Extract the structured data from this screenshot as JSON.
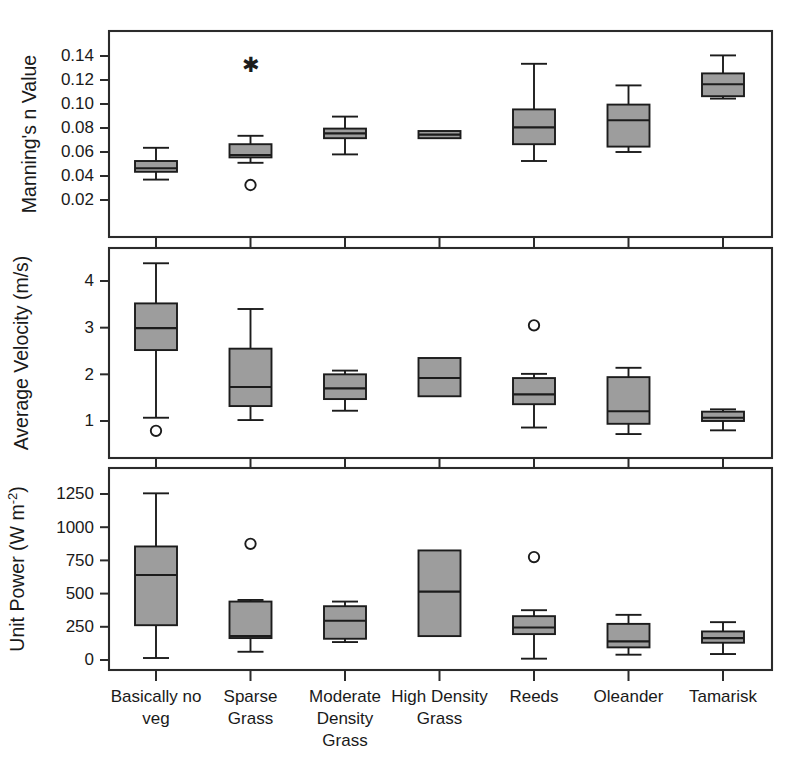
{
  "figure": {
    "background_color": "#ffffff",
    "box_fill_color": "#9d9d9d",
    "line_color": "#1c1c1c"
  },
  "chart_data": [
    {
      "type": "box",
      "panel": 1,
      "title": "",
      "ylabel": "Manning's n Value",
      "xlabel": "",
      "ylim": [
        0.0125,
        0.156
      ],
      "yticks": [
        0.02,
        0.04,
        0.06,
        0.08,
        0.1,
        0.12,
        0.14
      ],
      "ytick_labels": [
        "0.02",
        "0.04",
        "0.06",
        "0.08",
        "0.10",
        "0.12",
        "0.14"
      ],
      "grid": false,
      "legend": "none",
      "categories": [
        "Basically no veg",
        "Sparse Grass",
        "Moderate Density Grass",
        "High Density Grass",
        "Reeds",
        "Oleander",
        "Tamarisk"
      ],
      "boxes": [
        {
          "category": "Basically no veg",
          "whisker_low": 0.037,
          "q1": 0.0435,
          "median": 0.0465,
          "q3": 0.0525,
          "whisker_high": 0.0635,
          "outliers": [],
          "stars": []
        },
        {
          "category": "Sparse Grass",
          "whisker_low": 0.051,
          "q1": 0.0555,
          "median": 0.0575,
          "q3": 0.0665,
          "whisker_high": 0.0735,
          "outliers": [
            0.0325
          ],
          "stars": [
            0.1325
          ]
        },
        {
          "category": "Moderate Density Grass",
          "whisker_low": 0.058,
          "q1": 0.0715,
          "median": 0.0755,
          "q3": 0.0795,
          "whisker_high": 0.0895,
          "outliers": [],
          "stars": []
        },
        {
          "category": "High Density Grass",
          "whisker_low": 0.0715,
          "q1": 0.0715,
          "median": 0.0745,
          "q3": 0.0775,
          "whisker_high": 0.0775,
          "outliers": [],
          "stars": []
        },
        {
          "category": "Reeds",
          "whisker_low": 0.0525,
          "q1": 0.0665,
          "median": 0.0805,
          "q3": 0.0955,
          "whisker_high": 0.1335,
          "outliers": [],
          "stars": []
        },
        {
          "category": "Oleander",
          "whisker_low": 0.06,
          "q1": 0.0645,
          "median": 0.0865,
          "q3": 0.0995,
          "whisker_high": 0.1155,
          "outliers": [],
          "stars": []
        },
        {
          "category": "Tamarisk",
          "whisker_low": 0.1045,
          "q1": 0.1065,
          "median": 0.1165,
          "q3": 0.1255,
          "whisker_high": 0.1405,
          "outliers": [],
          "stars": []
        }
      ]
    },
    {
      "type": "box",
      "panel": 2,
      "title": "",
      "ylabel": "Average Velocity (m/s)",
      "xlabel": "",
      "ylim": [
        0.45,
        4.75
      ],
      "yticks": [
        1,
        2,
        3,
        4
      ],
      "ytick_labels": [
        "1",
        "2",
        "3",
        "4"
      ],
      "grid": false,
      "legend": "none",
      "categories": [
        "Basically no veg",
        "Sparse Grass",
        "Moderate Density Grass",
        "High Density Grass",
        "Reeds",
        "Oleander",
        "Tamarisk"
      ],
      "boxes": [
        {
          "category": "Basically no veg",
          "whisker_low": 1.07,
          "q1": 2.52,
          "median": 2.99,
          "q3": 3.52,
          "whisker_high": 4.38,
          "outliers": [
            0.79
          ],
          "stars": []
        },
        {
          "category": "Sparse Grass",
          "whisker_low": 1.02,
          "q1": 1.32,
          "median": 1.73,
          "q3": 2.55,
          "whisker_high": 3.4,
          "outliers": [],
          "stars": []
        },
        {
          "category": "Moderate Density Grass",
          "whisker_low": 1.22,
          "q1": 1.47,
          "median": 1.7,
          "q3": 2.0,
          "whisker_high": 2.08,
          "outliers": [],
          "stars": []
        },
        {
          "category": "High Density Grass",
          "whisker_low": 1.53,
          "q1": 1.53,
          "median": 1.92,
          "q3": 2.35,
          "whisker_high": 2.35,
          "outliers": [],
          "stars": []
        },
        {
          "category": "Reeds",
          "whisker_low": 0.86,
          "q1": 1.36,
          "median": 1.57,
          "q3": 1.92,
          "whisker_high": 2.01,
          "outliers": [
            3.05
          ],
          "stars": []
        },
        {
          "category": "Oleander",
          "whisker_low": 0.72,
          "q1": 0.94,
          "median": 1.21,
          "q3": 1.94,
          "whisker_high": 2.14,
          "outliers": [],
          "stars": []
        },
        {
          "category": "Tamarisk",
          "whisker_low": 0.8,
          "q1": 1.0,
          "median": 1.07,
          "q3": 1.2,
          "whisker_high": 1.25,
          "outliers": [],
          "stars": []
        }
      ]
    },
    {
      "type": "box",
      "panel": 3,
      "title": "",
      "ylabel": "Unit Power (W m-2)",
      "ylabel_base": "Unit Power (W m",
      "ylabel_exponent": "-2",
      "ylabel_close": ")",
      "xlabel": "",
      "ylim": [
        -90,
        1450
      ],
      "yticks": [
        0,
        250,
        500,
        750,
        1000,
        1250
      ],
      "ytick_labels": [
        "0",
        "250",
        "500",
        "750",
        "1000",
        "1250"
      ],
      "grid": false,
      "legend": "none",
      "categories": [
        "Basically no veg",
        "Sparse Grass",
        "Moderate Density Grass",
        "High Density Grass",
        "Reeds",
        "Oleander",
        "Tamarisk"
      ],
      "boxes": [
        {
          "category": "Basically no veg",
          "whisker_low": 15,
          "q1": 262,
          "median": 640,
          "q3": 855,
          "whisker_high": 1255,
          "outliers": [],
          "stars": []
        },
        {
          "category": "Sparse Grass",
          "whisker_low": 62,
          "q1": 165,
          "median": 180,
          "q3": 440,
          "whisker_high": 452,
          "outliers": [
            875
          ],
          "stars": []
        },
        {
          "category": "Moderate Density Grass",
          "whisker_low": 135,
          "q1": 160,
          "median": 295,
          "q3": 405,
          "whisker_high": 440,
          "outliers": [],
          "stars": []
        },
        {
          "category": "High Density Grass",
          "whisker_low": 180,
          "q1": 180,
          "median": 515,
          "q3": 825,
          "whisker_high": 825,
          "outliers": [],
          "stars": []
        },
        {
          "category": "Reeds",
          "whisker_low": 10,
          "q1": 195,
          "median": 245,
          "q3": 330,
          "whisker_high": 375,
          "outliers": [
            775
          ],
          "stars": []
        },
        {
          "category": "Oleander",
          "whisker_low": 40,
          "q1": 95,
          "median": 140,
          "q3": 272,
          "whisker_high": 340,
          "outliers": [],
          "stars": []
        },
        {
          "category": "Tamarisk",
          "whisker_low": 45,
          "q1": 130,
          "median": 165,
          "q3": 215,
          "whisker_high": 285,
          "outliers": [],
          "stars": []
        }
      ]
    }
  ],
  "x_axis": {
    "categories": [
      {
        "lines": [
          "Basically no",
          "veg"
        ]
      },
      {
        "lines": [
          "Sparse",
          "Grass"
        ]
      },
      {
        "lines": [
          "Moderate",
          "Density",
          "Grass"
        ]
      },
      {
        "lines": [
          "High Density",
          "Grass"
        ]
      },
      {
        "lines": [
          "Reeds"
        ]
      },
      {
        "lines": [
          "Oleander"
        ]
      },
      {
        "lines": [
          "Tamarisk"
        ]
      }
    ]
  }
}
